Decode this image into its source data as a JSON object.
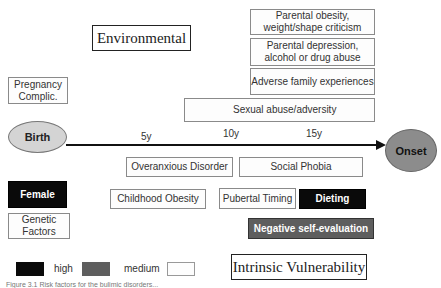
{
  "titles": {
    "environmental": "Environmental",
    "intrinsic": "Intrinsic Vulnerability"
  },
  "timeline": {
    "start": "Birth",
    "end": "Onset",
    "ticks": [
      "5y",
      "10y",
      "15y"
    ]
  },
  "environmental_factors": [
    {
      "label": "Parental obesity, weight/shape criticism",
      "level": "low"
    },
    {
      "label": "Parental depression, alcohol or drug abuse",
      "level": "low"
    },
    {
      "label": "Adverse family experiences",
      "level": "low"
    },
    {
      "label": "Sexual abuse/adversity",
      "level": "low"
    },
    {
      "label": "Pregnancy Complic.",
      "level": "low"
    }
  ],
  "intrinsic_factors": [
    {
      "label": "Overanxious Disorder",
      "level": "low"
    },
    {
      "label": "Social Phobia",
      "level": "low"
    },
    {
      "label": "Female",
      "level": "high"
    },
    {
      "label": "Childhood Obesity",
      "level": "low"
    },
    {
      "label": "Pubertal Timing",
      "level": "low"
    },
    {
      "label": "Dieting",
      "level": "high"
    },
    {
      "label": "Genetic Factors",
      "level": "low"
    },
    {
      "label": "Negative self-evaluation",
      "level": "medium"
    }
  ],
  "legend": {
    "high": "high",
    "medium": "medium",
    "colors": {
      "high": "#0a0a0a",
      "medium": "#5e5e5e",
      "low": "#fdfdfd"
    }
  },
  "caption": "Figure 3.1 Risk factors for the bulimic disorders..."
}
